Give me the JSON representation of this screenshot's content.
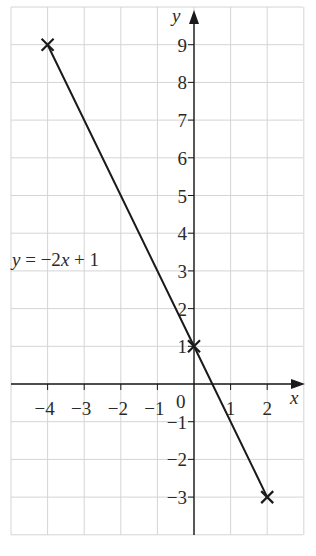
{
  "chart_data": {
    "type": "line",
    "title": "",
    "xlabel": "x",
    "ylabel": "y",
    "xlim": [
      -5,
      3
    ],
    "ylim": [
      -4,
      10
    ],
    "grid": true,
    "x_ticks": [
      "-4",
      "-3",
      "-2",
      "-1",
      "1",
      "2"
    ],
    "y_ticks": [
      "9",
      "8",
      "7",
      "6",
      "5",
      "4",
      "3",
      "2",
      "1",
      "-1",
      "-2",
      "-3"
    ],
    "origin_label": "0",
    "series": [
      {
        "name": "y = −2x + 1",
        "x": [
          -4,
          0,
          2
        ],
        "y": [
          9,
          1,
          -3
        ],
        "marked_points": [
          [
            -4,
            9
          ],
          [
            0,
            1
          ],
          [
            2,
            -3
          ]
        ],
        "marker": "x"
      }
    ],
    "annotations": [
      {
        "text": "y = −2x + 1",
        "x": -4.9,
        "y": 3.4
      }
    ]
  },
  "labels": {
    "equation": "y = −2x + 1",
    "x_axis": "x",
    "y_axis": "y",
    "origin": "0"
  },
  "style": {
    "line_color": "#1a1a1a",
    "grid_color": "#d4d4d4",
    "axis_color": "#1a1a1a"
  }
}
